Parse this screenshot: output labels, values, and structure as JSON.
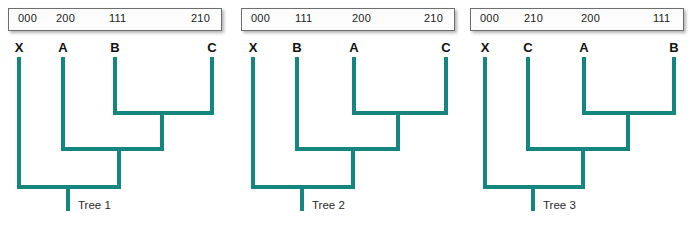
{
  "figure": {
    "accent_color": "#15857F",
    "background_color": "#FFFFFF",
    "label_color": "#111111"
  },
  "panels": [
    {
      "id": "tree-1",
      "caption": "Tree 1",
      "state_row": {
        "codes": [
          "000",
          "200",
          "111",
          "210"
        ]
      },
      "taxa": [
        "X",
        "A",
        "B",
        "C"
      ],
      "topology": "(X,(A,(B,C)))"
    },
    {
      "id": "tree-2",
      "caption": "Tree 2",
      "state_row": {
        "codes": [
          "000",
          "111",
          "200",
          "210"
        ]
      },
      "taxa": [
        "X",
        "B",
        "A",
        "C"
      ],
      "topology": "(X,(B,(A,C)))"
    },
    {
      "id": "tree-3",
      "caption": "Tree 3",
      "state_row": {
        "codes": [
          "000",
          "210",
          "200",
          "111"
        ]
      },
      "taxa": [
        "X",
        "C",
        "A",
        "B"
      ],
      "topology": "(X,(C,(A,B)))"
    }
  ]
}
